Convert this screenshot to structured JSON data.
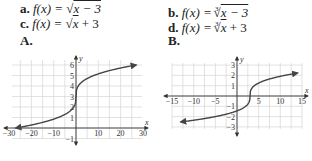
{
  "options": [
    {
      "letter": "a.",
      "fn": "f(x) = ",
      "rad": "x − 3",
      "root_index": "",
      "after": ""
    },
    {
      "letter": "b.",
      "fn": "f(x) = ",
      "rad": "x − 3",
      "root_index": "3",
      "after": ""
    },
    {
      "letter": "c.",
      "fn": "f(x) = ",
      "rad": "x",
      "root_index": "",
      "after": " + 3"
    },
    {
      "letter": "d.",
      "fn": "f(x) = ",
      "rad": "x",
      "root_index": "3",
      "after": " + 3"
    }
  ],
  "graph_labels": {
    "A": "A.",
    "B": "B."
  },
  "chart_data": [
    {
      "type": "line",
      "label": "A.",
      "title": "",
      "xlabel": "x",
      "ylabel": "y",
      "xlim": [
        -30,
        30
      ],
      "ylim": [
        -1,
        6
      ],
      "grid": true,
      "x_ticks": [
        -30,
        -20,
        -10,
        10,
        20,
        30
      ],
      "y_ticks": [
        -1,
        1,
        2,
        3,
        4,
        5,
        6
      ],
      "function": "f(x) = cbrt(x) + 3",
      "series": [
        {
          "name": "f(x)",
          "x": [
            -27,
            -20,
            -10,
            -5,
            -1,
            0,
            1,
            5,
            10,
            20,
            27
          ],
          "y": [
            0,
            0.29,
            0.85,
            1.29,
            2,
            3,
            4,
            4.71,
            5.15,
            5.71,
            6
          ]
        }
      ]
    },
    {
      "type": "line",
      "label": "B.",
      "title": "",
      "xlabel": "x",
      "ylabel": "y",
      "xlim": [
        -15,
        15
      ],
      "ylim": [
        -3,
        3
      ],
      "grid": true,
      "x_ticks": [
        -15,
        -10,
        -5,
        5,
        10,
        15
      ],
      "y_ticks": [
        -3,
        -2,
        -1,
        1,
        2,
        3
      ],
      "function": "f(x) = cbrt(x - 3)",
      "series": [
        {
          "name": "f(x)",
          "x": [
            -13,
            -10,
            -5,
            0,
            2,
            3,
            4,
            6,
            10,
            14
          ],
          "y": [
            -2.52,
            -2.35,
            -2,
            -1.44,
            -1,
            0,
            1,
            1.44,
            1.91,
            2.22
          ]
        }
      ]
    }
  ]
}
